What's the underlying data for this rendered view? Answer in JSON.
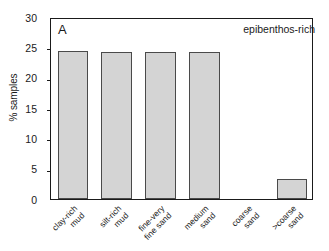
{
  "figure": {
    "panel_label": "A",
    "annotation": "epibenthos-rich"
  },
  "chart_data": {
    "type": "bar",
    "title": "",
    "subtitle": "",
    "panel": "A",
    "annotation": "epibenthos-rich",
    "xlabel": "",
    "ylabel": "% samples",
    "ylim": [
      0,
      30
    ],
    "yticks": [
      0,
      5,
      10,
      15,
      20,
      25,
      30
    ],
    "ytick_labels": [
      "0",
      "5",
      "10",
      "15",
      "20",
      "25",
      "30"
    ],
    "grid": false,
    "legend": "none",
    "bar_color": "#d4d4d4",
    "bar_edge_color": "#4a4a4a",
    "axis_color": "#1a1a1a",
    "categories": [
      "clay-rich mud",
      "silt-rich mud",
      "fine-very fine sand",
      "medium sand",
      "coarse sand",
      ">coarse sand"
    ],
    "category_lines": [
      [
        "clay-rich",
        "mud"
      ],
      [
        "silt-rich",
        "mud"
      ],
      [
        "fine-very",
        "fine sand"
      ],
      [
        "medium",
        "sand"
      ],
      [
        "coarse",
        "sand"
      ],
      [
        ">coarse",
        "sand"
      ]
    ],
    "values": [
      24.4,
      24.3,
      24.3,
      24.3,
      0,
      3.3
    ]
  }
}
